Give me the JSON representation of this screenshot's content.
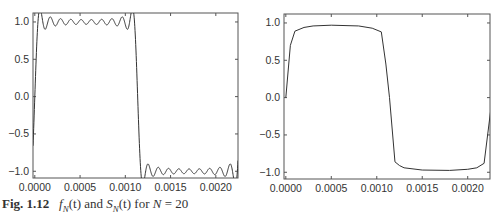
{
  "caption": {
    "label": "Fig. 1.12",
    "text_parts": [
      "f",
      "N",
      "(t)",
      " and ",
      "S",
      "N",
      "(t)",
      " for ",
      "N",
      " = 20"
    ]
  },
  "chart_data": [
    {
      "type": "line",
      "title": "f_N(t)",
      "xlabel": "",
      "ylabel": "",
      "xlim": [
        -2e-05,
        0.002245
      ],
      "ylim": [
        -1.09,
        1.12
      ],
      "xticks": [
        0.0,
        0.0005,
        0.001,
        0.0015,
        0.002
      ],
      "xtick_labels": [
        "0.0000",
        "0.0005",
        "0.0010",
        "0.0015",
        "0.0020"
      ],
      "yticks": [
        1.0,
        0.5,
        0.0,
        -0.5,
        -1.0
      ],
      "ytick_labels": [
        "1.0",
        "0.5",
        "0.0",
        "−0.5",
        "−1.0"
      ],
      "grid": false,
      "description": "Fourier partial sum of a square wave (period ~0.00227 s) with N = 20 harmonics, showing Gibbs ringing near +1 and -1",
      "series": [
        {
          "name": "f_N(t)",
          "n_harmonics": 20,
          "period": 0.0022727,
          "x_switch": 0.001136,
          "high_level": 1.0,
          "low_level": -1.0,
          "overshoot_peak": 1.09,
          "ripple_amplitude": 0.03
        }
      ]
    },
    {
      "type": "line",
      "title": "S_N(t)",
      "xlabel": "",
      "ylabel": "",
      "xlim": [
        -2e-05,
        0.002245
      ],
      "ylim": [
        -1.09,
        1.12
      ],
      "xticks": [
        0.0,
        0.0005,
        0.001,
        0.0015,
        0.002
      ],
      "xtick_labels": [
        "0.0000",
        "0.0005",
        "0.0010",
        "0.0015",
        "0.0020"
      ],
      "yticks": [
        1.0,
        0.5,
        0.0,
        -0.5,
        -1.0
      ],
      "ytick_labels": [
        "1.0",
        "0.5",
        "0.0",
        "−0.5",
        "−1.0"
      ],
      "grid": false,
      "description": "Smoothed (sigma-factor / Cesaro) partial sum with N = 20, no Gibbs ringing; plateau ~0.97",
      "series": [
        {
          "name": "S_N(t)",
          "n_harmonics": 20,
          "x": [
            0.0,
            5e-05,
            0.0001,
            0.0002,
            0.0003,
            0.0005,
            0.0008,
            0.00095,
            0.00105,
            0.0011,
            0.00114,
            0.0012,
            0.00125,
            0.0013,
            0.0015,
            0.0018,
            0.002,
            0.0021,
            0.00218,
            0.00227
          ],
          "y": [
            0.0,
            0.7,
            0.89,
            0.94,
            0.96,
            0.97,
            0.96,
            0.93,
            0.88,
            0.45,
            0.0,
            -0.86,
            -0.91,
            -0.94,
            -0.97,
            -0.975,
            -0.96,
            -0.94,
            -0.88,
            0.0
          ]
        }
      ]
    }
  ]
}
